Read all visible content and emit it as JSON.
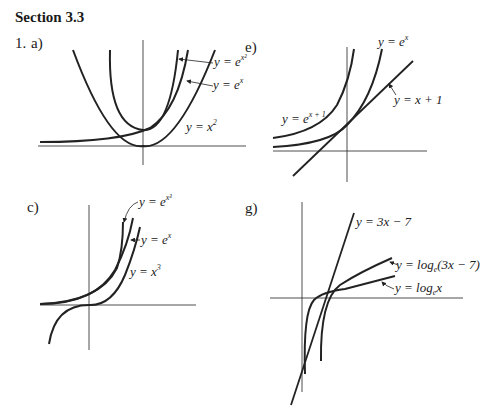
{
  "section": {
    "title": "Section 3.3"
  },
  "problem": {
    "number": "1."
  },
  "parts": [
    {
      "label": "a)",
      "curves": [
        {
          "name": "y = e^{x^2}",
          "lhs": "y = e",
          "sup": "x²"
        },
        {
          "name": "y = e^x",
          "lhs": "y = e",
          "sup": "x"
        },
        {
          "name": "y = x^2",
          "lhs": "y = x",
          "sup": "2"
        }
      ]
    },
    {
      "label": "e)",
      "curves": [
        {
          "name": "y = e^x",
          "lhs": "y = e",
          "sup": "x"
        },
        {
          "name": "y = e^{x+1}",
          "lhs": "y = e",
          "sup": "x + 1"
        },
        {
          "name": "y = x + 1",
          "text": "y = x + 1"
        }
      ]
    },
    {
      "label": "c)",
      "curves": [
        {
          "name": "y = e^{x^3}",
          "lhs": "y = e",
          "sup": "x³"
        },
        {
          "name": "y = e^x",
          "lhs": "y = e",
          "sup": "x"
        },
        {
          "name": "y = x^3",
          "lhs": "y = x",
          "sup": "3"
        }
      ]
    },
    {
      "label": "g)",
      "curves": [
        {
          "name": "y = 3x - 7",
          "text": "y = 3x − 7"
        },
        {
          "name": "y = log_e(3x - 7)",
          "lhs": "y = log",
          "sub": "e",
          "rest": "(3x − 7)"
        },
        {
          "name": "y = log_e x",
          "lhs": "y = log",
          "sub": "e",
          "rest": "x"
        }
      ]
    }
  ]
}
